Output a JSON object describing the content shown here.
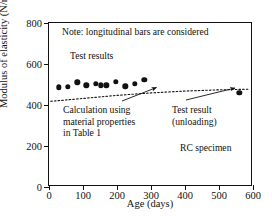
{
  "chart_data": {
    "type": "scatter",
    "title": "",
    "xlabel": "Age (days)",
    "ylabel": "Modulus of elasticity (N/mm2)",
    "ylabel_html": "Modulus of elasticity (N/mm<sup>2</sup>)",
    "xlim": [
      0,
      600
    ],
    "ylim": [
      0,
      800
    ],
    "xticks": [
      0,
      100,
      200,
      300,
      400,
      500,
      600
    ],
    "yticks": [
      0,
      200,
      400,
      600,
      800
    ],
    "grid": false,
    "legend": "none",
    "series": [
      {
        "name": "Test results",
        "style": "filled-circle-markers",
        "color": "#111111",
        "points": [
          {
            "x": 28,
            "y": 487
          },
          {
            "x": 55,
            "y": 489
          },
          {
            "x": 83,
            "y": 510
          },
          {
            "x": 110,
            "y": 497
          },
          {
            "x": 138,
            "y": 503
          },
          {
            "x": 152,
            "y": 496
          },
          {
            "x": 168,
            "y": 497
          },
          {
            "x": 196,
            "y": 512
          },
          {
            "x": 224,
            "y": 492
          },
          {
            "x": 252,
            "y": 502
          },
          {
            "x": 280,
            "y": 523
          }
        ]
      },
      {
        "name": "Test result (unloading)",
        "style": "filled-circle-marker",
        "color": "#111111",
        "points": [
          {
            "x": 560,
            "y": 460
          }
        ]
      },
      {
        "name": "Calculation using material properties in Table 1",
        "style": "dotted-line",
        "color": "#111111",
        "points": [
          {
            "x": 5,
            "y": 418
          },
          {
            "x": 100,
            "y": 432
          },
          {
            "x": 200,
            "y": 447
          },
          {
            "x": 300,
            "y": 459
          },
          {
            "x": 400,
            "y": 468
          },
          {
            "x": 500,
            "y": 474
          },
          {
            "x": 585,
            "y": 477
          }
        ]
      }
    ],
    "annotations": [
      {
        "name": "note",
        "text": "Note: longitudinal bars are considered"
      },
      {
        "name": "series",
        "text": "Test results"
      },
      {
        "name": "calculation",
        "text": "Calculation using\nmaterial properties\nin Table 1",
        "arrow_to": {
          "x": 320,
          "y": 462
        }
      },
      {
        "name": "unloading",
        "text": "Test result\n(unloading)",
        "arrow_to": {
          "x": 560,
          "y": 460
        }
      },
      {
        "name": "specimen",
        "text": "RC specimen"
      }
    ]
  },
  "axes": {
    "x_label": "Age (days)",
    "x_ticks": [
      "0",
      "100",
      "200",
      "300",
      "400",
      "500",
      "600"
    ],
    "y_ticks": [
      "0",
      "200",
      "400",
      "600",
      "800"
    ]
  },
  "annotations": {
    "note": "Note: longitudinal bars are considered",
    "series_label": "Test results",
    "calc_line1": "Calculation using",
    "calc_line2": "material properties",
    "calc_line3": "in Table 1",
    "unload_line1": "Test result",
    "unload_line2": "(unloading)",
    "specimen": "RC specimen"
  }
}
